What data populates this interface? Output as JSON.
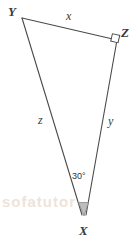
{
  "figure": {
    "type": "geometry-diagram",
    "shape": "triangle",
    "background_color": "#ffffff",
    "stroke_color": "#4a4a4a",
    "label_color": "#3a3a3a",
    "marker_fill": "#bfbfbf",
    "vertices": [
      {
        "name": "Y",
        "label": "Y",
        "x": 22,
        "y": 18
      },
      {
        "name": "Z",
        "label": "Z",
        "x": 117,
        "y": 40
      },
      {
        "name": "X",
        "label": "X",
        "x": 84,
        "y": 216
      }
    ],
    "sides": [
      {
        "name": "side-x",
        "label": "x",
        "from": "Y",
        "to": "Z"
      },
      {
        "name": "side-y",
        "label": "y",
        "from": "Z",
        "to": "X"
      },
      {
        "name": "side-z",
        "label": "z",
        "from": "Y",
        "to": "X"
      }
    ],
    "angles": [
      {
        "name": "angle-X",
        "label": "30°",
        "at": "X",
        "measure": 30,
        "marker": "shaded-sector"
      },
      {
        "name": "angle-Z",
        "label": "",
        "at": "Z",
        "measure": 90,
        "marker": "right-angle-square"
      }
    ],
    "watermark": "sofatutor"
  }
}
